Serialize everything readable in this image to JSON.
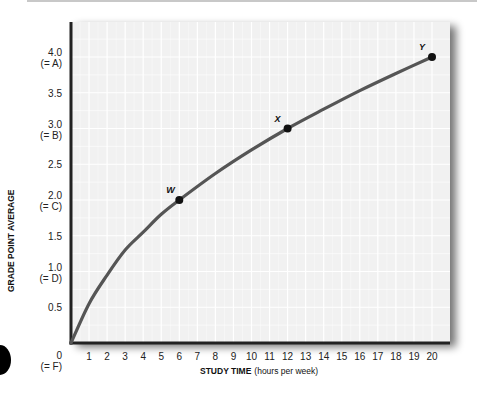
{
  "chart_data": {
    "type": "line",
    "title": "",
    "xlabel": "STUDY TIME",
    "xlabel_units": "(hours per week)",
    "ylabel": "GRADE POINT AVERAGE",
    "xlim": [
      0,
      20
    ],
    "ylim": [
      0,
      4.0
    ],
    "grid": true,
    "legend": null,
    "x_ticks": [
      "0",
      "1",
      "2",
      "3",
      "4",
      "5",
      "6",
      "7",
      "8",
      "9",
      "10",
      "11",
      "12",
      "13",
      "14",
      "15",
      "16",
      "17",
      "18",
      "19",
      "20"
    ],
    "x_tick_zero_sub": "(= F)",
    "y_ticks": [
      {
        "value": 0.5,
        "label": "0.5",
        "sub": ""
      },
      {
        "value": 1.0,
        "label": "1.0",
        "sub": "(= D)"
      },
      {
        "value": 1.5,
        "label": "1.5",
        "sub": ""
      },
      {
        "value": 2.0,
        "label": "2.0",
        "sub": "(= C)"
      },
      {
        "value": 2.5,
        "label": "2.5",
        "sub": ""
      },
      {
        "value": 3.0,
        "label": "3.0",
        "sub": "(= B)"
      },
      {
        "value": 3.5,
        "label": "3.5",
        "sub": ""
      },
      {
        "value": 4.0,
        "label": "4.0",
        "sub": "(= A)"
      }
    ],
    "series": [
      {
        "name": "GPA vs study time",
        "x": [
          0,
          1,
          2,
          3,
          4,
          5,
          6,
          8,
          10,
          12,
          14,
          16,
          18,
          20
        ],
        "y": [
          0,
          0.55,
          0.95,
          1.3,
          1.55,
          1.8,
          2.0,
          2.37,
          2.7,
          3.0,
          3.27,
          3.53,
          3.77,
          4.0
        ]
      }
    ],
    "annotations": [
      {
        "label": "W",
        "x": 6,
        "y": 2.0
      },
      {
        "label": "X",
        "x": 12,
        "y": 3.0
      },
      {
        "label": "Y",
        "x": 20,
        "y": 4.0
      }
    ]
  },
  "colors": {
    "curve": "#555555",
    "axis": "#222222",
    "plot_bg": "#f1f1f1",
    "grid": "#ffffff",
    "point": "#111111"
  }
}
